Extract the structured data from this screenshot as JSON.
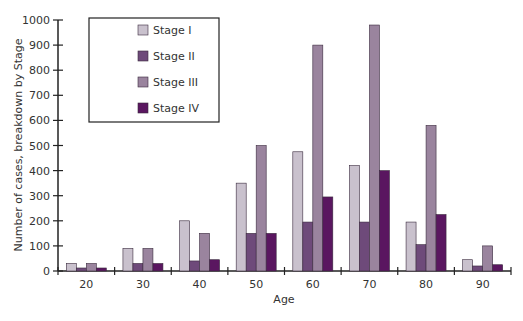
{
  "chart_data": {
    "type": "bar",
    "title": "",
    "xlabel": "Age",
    "ylabel": "Number of cases, breakdown by Stage",
    "ylim": [
      0,
      1000
    ],
    "yticks": [
      0,
      100,
      200,
      300,
      400,
      500,
      600,
      700,
      800,
      900,
      1000
    ],
    "categories": [
      "20",
      "30",
      "40",
      "50",
      "60",
      "70",
      "80",
      "90"
    ],
    "series": [
      {
        "name": "Stage I",
        "color": "#c9c1cd",
        "values": [
          30,
          90,
          200,
          350,
          475,
          420,
          195,
          45
        ]
      },
      {
        "name": "Stage II",
        "color": "#6e4a7a",
        "values": [
          12,
          30,
          40,
          150,
          195,
          195,
          105,
          20
        ]
      },
      {
        "name": "Stage III",
        "color": "#9a849e",
        "values": [
          30,
          90,
          150,
          500,
          900,
          980,
          580,
          100
        ]
      },
      {
        "name": "Stage IV",
        "color": "#5a1660",
        "values": [
          12,
          30,
          45,
          150,
          295,
          400,
          225,
          25
        ]
      }
    ],
    "legend": {
      "position": "upper-left-inside",
      "entries": [
        "Stage I",
        "Stage II",
        "Stage III",
        "Stage IV"
      ]
    },
    "grid": false
  }
}
